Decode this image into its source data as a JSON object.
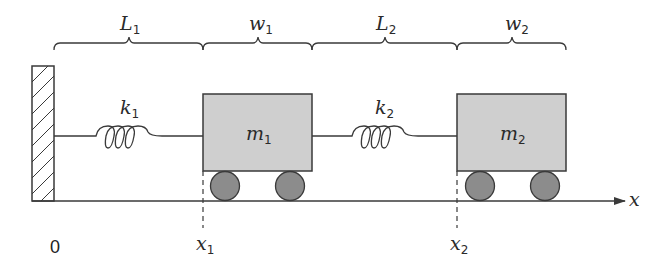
{
  "diagram": {
    "colors": {
      "line": "#3a3a3a",
      "mass_fill": "#cfcfcf",
      "wheel_fill": "#8c8c8c",
      "wall_hatch": "#3a3a3a"
    },
    "dimensions": [
      {
        "id": "L1",
        "base": "L",
        "sub": "1"
      },
      {
        "id": "w1",
        "base": "w",
        "sub": "1"
      },
      {
        "id": "L2",
        "base": "L",
        "sub": "2"
      },
      {
        "id": "w2",
        "base": "w",
        "sub": "2"
      }
    ],
    "springs": [
      {
        "id": "k1",
        "base": "k",
        "sub": "1"
      },
      {
        "id": "k2",
        "base": "k",
        "sub": "2"
      }
    ],
    "masses": [
      {
        "id": "m1",
        "base": "m",
        "sub": "1"
      },
      {
        "id": "m2",
        "base": "m",
        "sub": "2"
      }
    ],
    "positions": [
      {
        "id": "x1",
        "base": "x",
        "sub": "1"
      },
      {
        "id": "x2",
        "base": "x",
        "sub": "2"
      }
    ],
    "origin_label": "0",
    "axis_label": "x"
  }
}
